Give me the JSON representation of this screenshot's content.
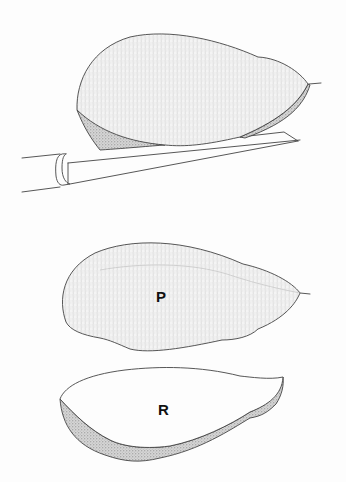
{
  "figure": {
    "type": "scientific illustration",
    "background_color": "#fdfdfd",
    "line_color": "#444444",
    "views": [
      {
        "id": "hafted-view",
        "description": "Flake resting on a shaft with a binding ring",
        "label": ""
      },
      {
        "id": "view-p",
        "label": "P"
      },
      {
        "id": "view-r",
        "label": "R"
      }
    ]
  }
}
